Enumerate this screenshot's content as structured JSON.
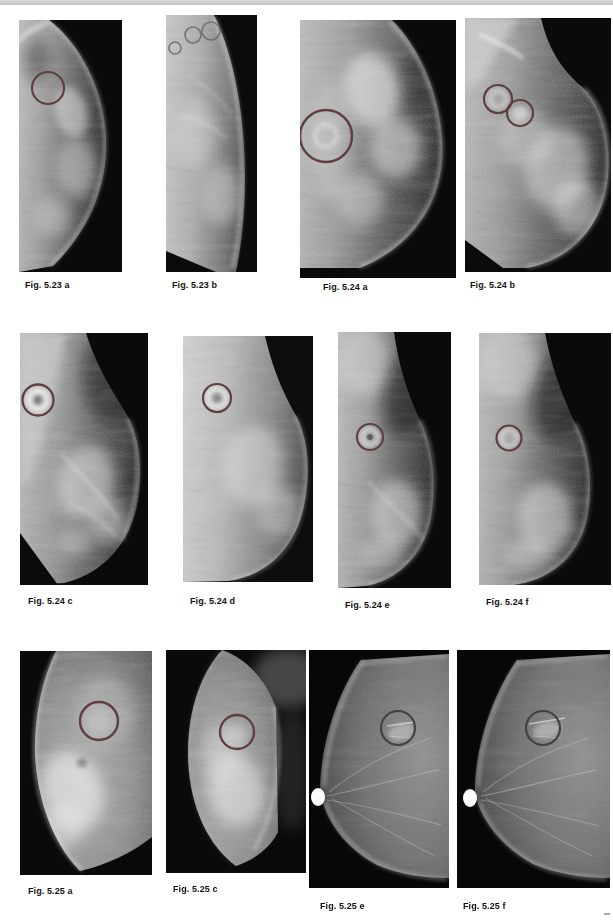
{
  "page": {
    "background_color": "#ffffff",
    "top_rule_color": "#c9c9c9",
    "content": "Atlas page of twelve mammogram images in three rows of four"
  },
  "colors": {
    "annotation_circle": "#5e4040",
    "annotation_circle_dark": "#474040",
    "marker_ring": "#6a6a6a",
    "film_background": "#0a0a0a"
  },
  "figures": [
    {
      "name": "fig-5.23a",
      "label": "Fig. 5.23 a",
      "annotation_circles": 1
    },
    {
      "name": "fig-5.23b",
      "label": "Fig. 5.23 b",
      "annotation_circles": 0,
      "marker_rings": 3
    },
    {
      "name": "fig-5.24a",
      "label": "Fig. 5.24 a",
      "annotation_circles": 1
    },
    {
      "name": "fig-5.24b",
      "label": "Fig. 5.24 b",
      "annotation_circles": 2
    },
    {
      "name": "fig-5.24c",
      "label": "Fig. 5.24 c",
      "annotation_circles": 1
    },
    {
      "name": "fig-5.24d",
      "label": "Fig. 5.24 d",
      "annotation_circles": 1
    },
    {
      "name": "fig-5.24e",
      "label": "Fig. 5.24 e",
      "annotation_circles": 1
    },
    {
      "name": "fig-5.24f",
      "label": "Fig. 5.24 f",
      "annotation_circles": 1
    },
    {
      "name": "fig-5.25a",
      "label": "Fig. 5.25 a",
      "annotation_circles": 1
    },
    {
      "name": "fig-5.25c",
      "label": "Fig. 5.25 c",
      "annotation_circles": 1
    },
    {
      "name": "fig-5.25e",
      "label": "Fig. 5.25 e",
      "annotation_circles": 1
    },
    {
      "name": "fig-5.25f",
      "label": "Fig. 5.25 f",
      "annotation_circles": 1
    }
  ]
}
